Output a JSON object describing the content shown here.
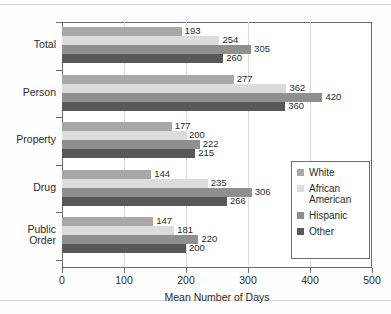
{
  "chart_data": {
    "type": "bar",
    "orientation": "horizontal",
    "title": "",
    "xlabel": "Mean Number of Days",
    "ylabel": "",
    "xlim": [
      0,
      500
    ],
    "xticks": [
      0,
      100,
      200,
      300,
      400,
      500
    ],
    "grid": true,
    "legend_position": "inside-right-lower",
    "categories": [
      "Total",
      "Person",
      "Property",
      "Drug",
      "Public Order"
    ],
    "category_labels": [
      [
        "Total"
      ],
      [
        "Person"
      ],
      [
        "Property"
      ],
      [
        "Drug"
      ],
      [
        "Public",
        "Order"
      ]
    ],
    "series": [
      {
        "name": "White",
        "color": "#a8a8a8",
        "values": [
          193,
          277,
          177,
          144,
          147
        ]
      },
      {
        "name": "African American",
        "color": "#dcdcdc",
        "values": [
          254,
          362,
          200,
          235,
          181
        ]
      },
      {
        "name": "Hispanic",
        "color": "#8f8f8f",
        "values": [
          305,
          420,
          222,
          306,
          220
        ]
      },
      {
        "name": "Other",
        "color": "#585858",
        "values": [
          260,
          360,
          215,
          266,
          200
        ]
      }
    ]
  },
  "legend": {
    "items": [
      {
        "label": "White",
        "color": "#a8a8a8"
      },
      {
        "label": "African\nAmerican",
        "color": "#dcdcdc"
      },
      {
        "label": "Hispanic",
        "color": "#8f8f8f"
      },
      {
        "label": "Other",
        "color": "#585858"
      }
    ]
  },
  "axis": {
    "x_title": "Mean Number of Days",
    "x_tick_labels": [
      "0",
      "100",
      "200",
      "300",
      "400",
      "500"
    ]
  }
}
